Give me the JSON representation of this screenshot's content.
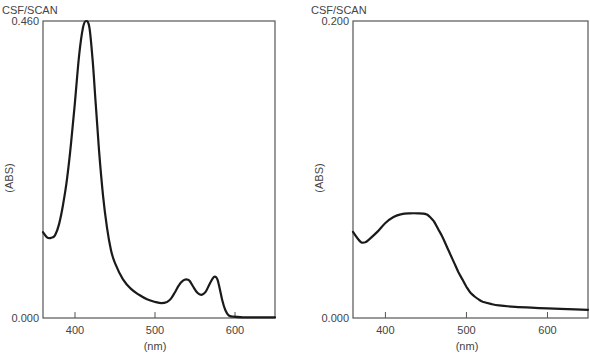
{
  "chart_data": [
    {
      "type": "line",
      "title": "CSF/SCAN",
      "xlabel": "(nm)",
      "ylabel": "(ABS)",
      "xlim": [
        360,
        650
      ],
      "ylim": [
        0,
        0.46
      ],
      "y_tick_labels": [
        "0.000",
        "0.460"
      ],
      "x_ticks": [
        400,
        500,
        600
      ],
      "x_tick_labels": [
        "400",
        "500",
        "600"
      ],
      "grid": false,
      "series": [
        {
          "name": "CSF scan 1",
          "x": [
            360,
            365,
            370,
            375,
            380,
            385,
            390,
            395,
            400,
            405,
            410,
            414,
            418,
            422,
            426,
            430,
            435,
            440,
            445,
            450,
            460,
            470,
            480,
            490,
            500,
            508,
            515,
            520,
            525,
            530,
            535,
            539,
            543,
            548,
            553,
            558,
            563,
            568,
            572,
            575,
            578,
            581,
            584,
            588,
            592,
            598,
            610,
            630,
            650
          ],
          "y": [
            0.133,
            0.125,
            0.124,
            0.128,
            0.145,
            0.175,
            0.215,
            0.27,
            0.335,
            0.405,
            0.45,
            0.46,
            0.45,
            0.4,
            0.33,
            0.26,
            0.19,
            0.14,
            0.105,
            0.085,
            0.06,
            0.045,
            0.036,
            0.029,
            0.025,
            0.023,
            0.025,
            0.03,
            0.04,
            0.051,
            0.058,
            0.06,
            0.058,
            0.048,
            0.039,
            0.036,
            0.04,
            0.052,
            0.061,
            0.064,
            0.06,
            0.045,
            0.028,
            0.012,
            0.004,
            0.002,
            0.001,
            0.001,
            0.001
          ]
        }
      ]
    },
    {
      "type": "line",
      "title": "CSF/SCAN",
      "xlabel": "(nm)",
      "ylabel": "(ABS)",
      "xlim": [
        360,
        650
      ],
      "ylim": [
        0,
        0.2
      ],
      "y_tick_labels": [
        "0.000",
        "0.200"
      ],
      "x_ticks": [
        400,
        500,
        600
      ],
      "x_tick_labels": [
        "400",
        "500",
        "600"
      ],
      "grid": false,
      "series": [
        {
          "name": "CSF scan 2",
          "x": [
            360,
            365,
            370,
            375,
            380,
            390,
            400,
            410,
            420,
            430,
            440,
            450,
            455,
            460,
            465,
            470,
            475,
            480,
            485,
            490,
            495,
            500,
            505,
            510,
            515,
            520,
            530,
            540,
            560,
            580,
            600,
            625,
            650
          ],
          "y": [
            0.058,
            0.054,
            0.051,
            0.051,
            0.053,
            0.058,
            0.064,
            0.068,
            0.07,
            0.0705,
            0.0705,
            0.07,
            0.068,
            0.065,
            0.06,
            0.055,
            0.049,
            0.043,
            0.037,
            0.031,
            0.026,
            0.021,
            0.017,
            0.0145,
            0.0125,
            0.011,
            0.0095,
            0.0085,
            0.0075,
            0.007,
            0.0065,
            0.006,
            0.0055
          ]
        }
      ]
    }
  ]
}
